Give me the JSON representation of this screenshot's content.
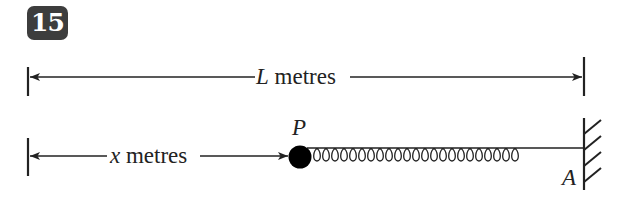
{
  "question_number": "15",
  "labels": {
    "total_length_var": "L",
    "total_length_unit": " metres",
    "distance_var": "x",
    "distance_unit": " metres",
    "particle": "P",
    "anchor": "A"
  },
  "colors": {
    "badge_bg": "#3d3d3d",
    "badge_text": "#ffffff",
    "line": "#222222",
    "particle": "#000000"
  },
  "diagram": {
    "spring_coils": 24
  }
}
